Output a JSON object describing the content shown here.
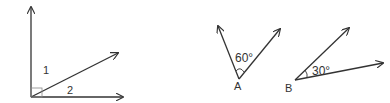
{
  "figures": [
    {
      "id": "right-angle-figure",
      "labels": {
        "angle1": "1",
        "angle2": "2"
      },
      "right_angle_marker": true
    },
    {
      "id": "angle-A",
      "vertex_label": "A",
      "angle_label": "60°"
    },
    {
      "id": "angle-B",
      "vertex_label": "B",
      "angle_label": "30°"
    }
  ],
  "colors": {
    "stroke": "#333333",
    "background": "#ffffff"
  }
}
